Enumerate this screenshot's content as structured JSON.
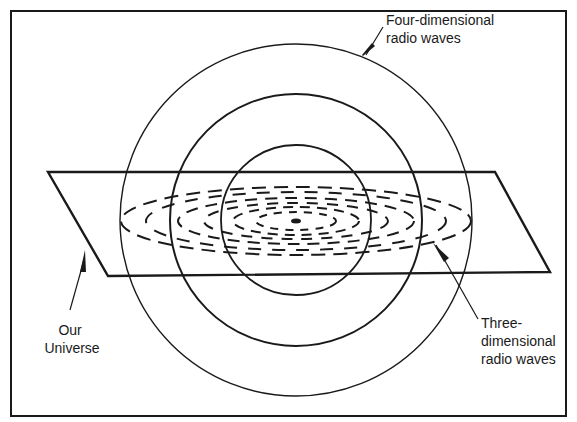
{
  "diagram": {
    "type": "concentric-waves-through-plane",
    "labels": {
      "four_dimensional": [
        "Four-dimensional",
        "radio waves"
      ],
      "our_universe": [
        "Our",
        "Universe"
      ],
      "three_dimensional": [
        "Three-",
        "dimensional",
        "radio waves"
      ]
    },
    "colors": {
      "ink": "#1a1a1a",
      "background": "#ffffff"
    },
    "geometry": {
      "center": [
        296,
        220
      ],
      "circle_radii": [
        176,
        126,
        75
      ],
      "dashed_ellipses": [
        {
          "rx": 175,
          "ry": 34
        },
        {
          "rx": 118,
          "ry": 23
        },
        {
          "rx": 63,
          "ry": 14
        }
      ],
      "plane": [
        [
          48,
          172
        ],
        [
          495,
          172
        ],
        [
          550,
          272
        ],
        [
          108,
          276
        ]
      ]
    }
  }
}
